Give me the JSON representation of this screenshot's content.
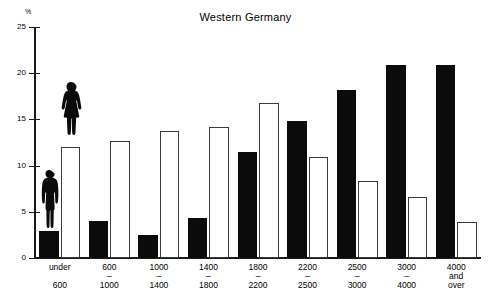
{
  "chart_data": {
    "type": "bar",
    "title": "Western Germany",
    "xlabel": "",
    "ylabel": "%",
    "ylim": [
      0,
      25
    ],
    "yticks": [
      0,
      5,
      10,
      15,
      20,
      25
    ],
    "ytick_labels": [
      "0",
      "5",
      "10",
      "15",
      "20",
      "25"
    ],
    "grid": false,
    "legend": "none",
    "legend_entries": [
      "Men (black bars, male silhouette)",
      "Women (white bars, female silhouette)"
    ],
    "categories": [
      "under 600",
      "600 - 1000",
      "1000 - 1400",
      "1400 - 1800",
      "1800 - 2200",
      "2200 - 2500",
      "2500 - 3000",
      "3000 - 4000",
      "4000 and over"
    ],
    "series": [
      {
        "name": "Men",
        "color": "#0b0b0b",
        "values": [
          2.9,
          4.0,
          2.5,
          4.3,
          11.5,
          14.8,
          18.2,
          20.9,
          20.9
        ]
      },
      {
        "name": "Women",
        "color": "#ffffff",
        "values": [
          12.0,
          12.7,
          13.8,
          14.2,
          16.8,
          10.9,
          8.3,
          6.6,
          3.9
        ]
      }
    ],
    "annotations": [
      {
        "name": "male-silhouette",
        "on": "Men / under 600",
        "description": "black standing man silhouette atop first black bar"
      },
      {
        "name": "female-silhouette",
        "on": "Women / under 600",
        "description": "black standing woman silhouette atop first white bar"
      }
    ]
  },
  "axis": {
    "unit_label": "%",
    "ticks": [
      "25",
      "20",
      "15",
      "10",
      "5",
      "0"
    ]
  },
  "xcategories": [
    {
      "line1": "under",
      "dash": "",
      "line2": "600"
    },
    {
      "line1": "600",
      "dash": "–",
      "line2": "1000"
    },
    {
      "line1": "1000",
      "dash": "–",
      "line2": "1400"
    },
    {
      "line1": "1400",
      "dash": "–",
      "line2": "1800"
    },
    {
      "line1": "1800",
      "dash": "–",
      "line2": "2200"
    },
    {
      "line1": "2200",
      "dash": "–",
      "line2": "2500"
    },
    {
      "line1": "2500",
      "dash": "–",
      "line2": "3000"
    },
    {
      "line1": "3000",
      "dash": "–",
      "line2": "4000"
    },
    {
      "line1": "4000",
      "dash": "and",
      "line2": "over"
    }
  ]
}
